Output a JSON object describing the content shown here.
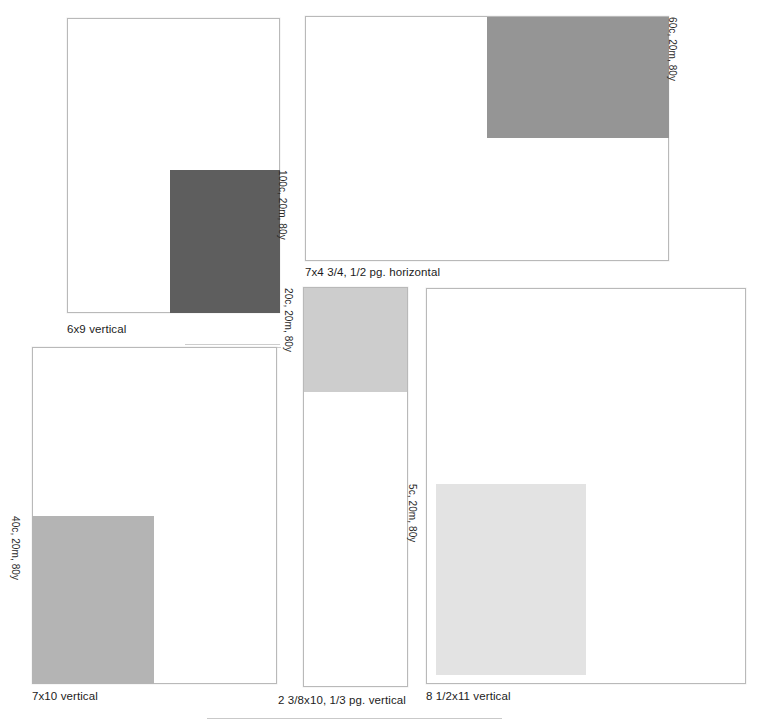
{
  "sheet": {
    "background_color": "#ffffff",
    "outline_color": "#b9b9b9",
    "rule_color": "#c9c9c9"
  },
  "specimens": [
    {
      "id": "6x9-vertical",
      "caption": "6x9 vertical",
      "ink_label": "100c, 20m, 80y",
      "swatch_color": "#5e5e5e",
      "box": {
        "x": 67,
        "y": 18,
        "w": 213,
        "h": 295
      },
      "swatch": {
        "x": 170,
        "y": 170,
        "w": 110,
        "h": 143
      },
      "caption_pos": {
        "x": 67,
        "y": 323
      },
      "vlabel_pos": {
        "x": 288,
        "y": 170
      }
    },
    {
      "id": "7x4.75-half-page-horizontal",
      "caption": "7x4 3/4, 1/2 pg. horizontal",
      "ink_label": "60c, 20m, 80y",
      "swatch_color": "#959595",
      "box": {
        "x": 305,
        "y": 16,
        "w": 364,
        "h": 245
      },
      "swatch": {
        "x": 487,
        "y": 17,
        "w": 182,
        "h": 121
      },
      "caption_pos": {
        "x": 305,
        "y": 266
      },
      "vlabel_pos": {
        "x": 678,
        "y": 17
      }
    },
    {
      "id": "7x10-vertical",
      "caption": "7x10 vertical",
      "ink_label": "40c, 20m, 80y",
      "swatch_color": "#b4b4b4",
      "box": {
        "x": 32,
        "y": 347,
        "w": 245,
        "h": 337
      },
      "swatch": {
        "x": 32,
        "y": 516,
        "w": 122,
        "h": 168
      },
      "caption_pos": {
        "x": 32,
        "y": 690
      },
      "vlabel_pos": {
        "x": 21,
        "y": 516
      }
    },
    {
      "id": "2.375x10-third-page-vertical",
      "caption": "2 3/8x10, 1/3 pg.  vertical",
      "ink_label": "20c, 20m, 80y",
      "swatch_color": "#cdcdcd",
      "box": {
        "x": 303,
        "y": 287,
        "w": 105,
        "h": 400
      },
      "swatch": {
        "x": 303,
        "y": 288,
        "w": 105,
        "h": 104
      },
      "caption_pos": {
        "x": 278,
        "y": 694
      },
      "vlabel_pos": {
        "x": 294,
        "y": 288
      }
    },
    {
      "id": "8.5x11-vertical",
      "caption": "8 1/2x11 vertical",
      "ink_label": "5c, 20m, 80y",
      "swatch_color": "#e3e3e3",
      "box": {
        "x": 426,
        "y": 288,
        "w": 320,
        "h": 396
      },
      "swatch": {
        "x": 436,
        "y": 484,
        "w": 150,
        "h": 191
      },
      "caption_pos": {
        "x": 426,
        "y": 690
      },
      "vlabel_pos": {
        "x": 418,
        "y": 484
      }
    }
  ],
  "bottom_rule": {
    "x": 207,
    "y": 718,
    "w": 295
  },
  "artifacts": [
    {
      "x": 185,
      "y": 344,
      "w": 95
    },
    {
      "x": 262,
      "y": 347,
      "w": 19
    }
  ]
}
